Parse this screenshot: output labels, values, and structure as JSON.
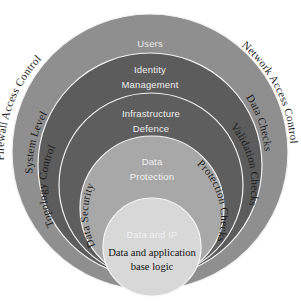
{
  "diagram": {
    "background_color": "#ffffff",
    "center": {
      "x": 150,
      "y": 152
    },
    "layers": [
      {
        "id": "layer-users",
        "ring_label": "Users",
        "ring_label_color": "#e8e8e8",
        "fill": "#8f8f8f",
        "stroke": "#f0f0f0",
        "left_curved_label": "Firewall Access Control",
        "right_curved_label": "Network Access Control",
        "cx": 150,
        "cy": 152,
        "r": 138,
        "label_y": 47
      },
      {
        "id": "layer-identity-management",
        "ring_label": "Identity",
        "ring_label_line2": "Management",
        "ring_label_color": "#ededed",
        "fill": "#5c5c5c",
        "stroke": "#f2f2f2",
        "left_curved_label": "System Level",
        "right_curved_label": "Data Checks",
        "cx": 150,
        "cy": 165,
        "r": 112,
        "label_y": 73
      },
      {
        "id": "layer-infrastructure-defence",
        "ring_label": "Infrastructure",
        "ring_label_line2": "Defence",
        "ring_label_color": "#ededed",
        "fill": "#5e5e5e",
        "stroke": "#f2f2f2",
        "left_curved_label": "Topology Control",
        "right_curved_label": "Validation Checks",
        "cx": 151,
        "cy": 185,
        "r": 92,
        "label_y": 117
      },
      {
        "id": "layer-data-protection",
        "ring_label": "Data",
        "ring_label_line2": "Protection",
        "ring_label_color": "#f0f0f0",
        "fill": "#a8a8a8",
        "stroke": "#f4f4f4",
        "left_curved_label": "Data Security",
        "right_curved_label": "Protection Checks",
        "cx": 152,
        "cy": 208,
        "r": 72,
        "label_y": 165
      },
      {
        "id": "layer-core",
        "ring_label": "Data and IP",
        "ring_label_color": "#f4f4f4",
        "fill": "#d8d8d8",
        "stroke": "#f6f6f6",
        "cx": 152,
        "cy": 247,
        "r": 49,
        "label_y": 234
      }
    ],
    "core": {
      "overlay_label": "Data and IP",
      "title_line1": "Data and application",
      "title_line2": "base logic",
      "title_color": "#141414"
    }
  }
}
